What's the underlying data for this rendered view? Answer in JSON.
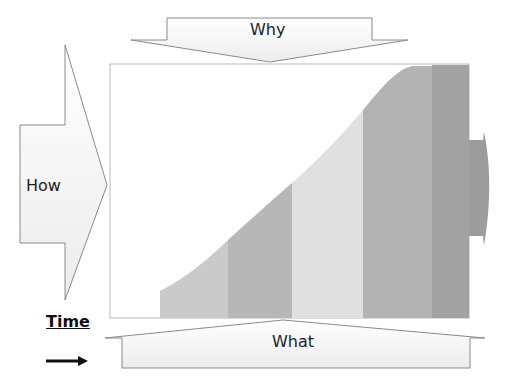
{
  "diagram": {
    "labels": {
      "why": "Why",
      "how": "How",
      "what": "What",
      "time": "Time"
    },
    "colors": {
      "arrow_fill": "#f4f4f4",
      "arrow_stroke": "#8a8a8a",
      "chart_border": "#b8b8b8",
      "band_1": "#cacaca",
      "band_2": "#b7b7b7",
      "band_3": "#e0e0e0",
      "band_4": "#b3b3b3",
      "band_5": "#a2a2a2",
      "right_arrow": "#9a9a9a"
    },
    "stages": [
      {
        "index": 1,
        "x_start": 160,
        "x_end": 228
      },
      {
        "index": 2,
        "x_start": 228,
        "x_end": 292
      },
      {
        "index": 3,
        "x_start": 292,
        "x_end": 363
      },
      {
        "index": 4,
        "x_start": 363,
        "x_end": 432
      },
      {
        "index": 5,
        "x_start": 432,
        "x_end": 469
      }
    ]
  }
}
